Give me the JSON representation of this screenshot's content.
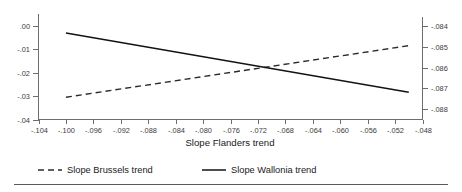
{
  "chart_data": {
    "type": "line",
    "title": "",
    "xlabel": "Slope Flanders trend",
    "ylabel": "",
    "grid": false,
    "legend_position": "bottom",
    "x": [
      -0.104,
      -0.1,
      -0.096,
      -0.092,
      -0.088,
      -0.084,
      -0.08,
      -0.076,
      -0.072,
      -0.068,
      -0.064,
      -0.06,
      -0.056,
      -0.052,
      -0.048
    ],
    "xtick_labels": [
      "-.104",
      "-.100",
      "-.096",
      "-.092",
      "-.088",
      "-.084",
      "-.080",
      "-.076",
      "-.072",
      "-.068",
      "-.064",
      "-.060",
      "-.056",
      "-.052",
      "-.048"
    ],
    "xlim": [
      -0.104,
      -0.048
    ],
    "left_axis": {
      "label": "",
      "ylim": [
        -0.04,
        0.005
      ],
      "ytick_values": [
        0.0,
        -0.01,
        -0.02,
        -0.03,
        -0.04
      ],
      "ytick_labels": [
        ".00",
        "-.01",
        "-.02",
        "-.03",
        "-.04"
      ]
    },
    "right_axis": {
      "label": "",
      "ylim": [
        -0.0885,
        -0.0834
      ],
      "ytick_values": [
        -0.084,
        -0.085,
        -0.086,
        -0.087,
        -0.088
      ],
      "ytick_labels": [
        "-.084",
        "-.085",
        "-.086",
        "-.087",
        "-.088"
      ]
    },
    "series": [
      {
        "name": "Slope Brussels trend",
        "axis": "left",
        "style": "dashed",
        "color": "#2b2b2b",
        "x": [
          -0.1,
          -0.05
        ],
        "values": [
          -0.0305,
          -0.0085
        ]
      },
      {
        "name": "Slope Wallonia trend",
        "axis": "right",
        "style": "solid",
        "color": "#131313",
        "x": [
          -0.1,
          -0.05
        ],
        "values": [
          -0.08432,
          -0.08718
        ]
      }
    ],
    "legend": [
      {
        "label": "Slope Brussels trend",
        "style": "dashed",
        "color": "#2b2b2b"
      },
      {
        "label": "Slope Wallonia trend",
        "style": "solid",
        "color": "#131313"
      }
    ]
  }
}
